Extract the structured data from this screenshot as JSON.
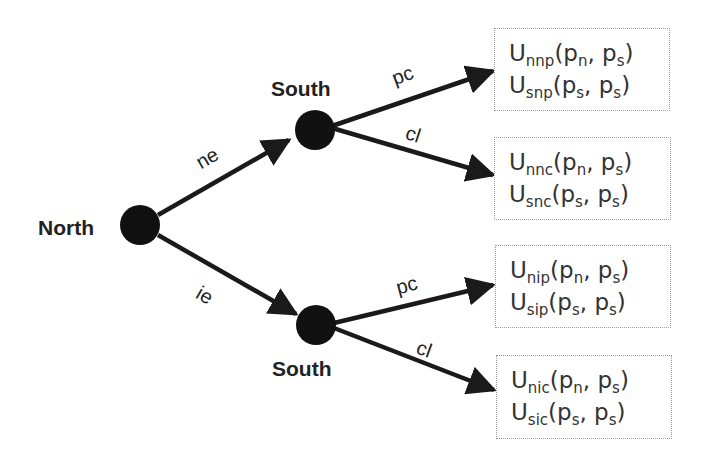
{
  "diagram": {
    "type": "game-tree",
    "nodes": {
      "north": {
        "label": "North"
      },
      "south_top": {
        "label": "South"
      },
      "south_bottom": {
        "label": "South"
      }
    },
    "edges": {
      "ne": {
        "label": "ne"
      },
      "ie": {
        "label": "ie"
      },
      "top_pc": {
        "label": "pc"
      },
      "top_cl": {
        "label": "cl"
      },
      "bottom_pc": {
        "label": "pc"
      },
      "bottom_cl": {
        "label": "cl"
      }
    },
    "payoffs": [
      {
        "line1": {
          "base": "U",
          "sub": "nnp",
          "open": "(p",
          "arg1sub": "n",
          "mid": ", p",
          "arg2sub": "s",
          "close": ")"
        },
        "line2": {
          "base": "U",
          "sub": "snp",
          "open": "(p",
          "arg1sub": "s",
          "mid": ", p",
          "arg2sub": "s",
          "close": ")"
        }
      },
      {
        "line1": {
          "base": "U",
          "sub": "nnc",
          "open": "(p",
          "arg1sub": "n",
          "mid": ", p",
          "arg2sub": "s",
          "close": ")"
        },
        "line2": {
          "base": "U",
          "sub": "snc",
          "open": "(p",
          "arg1sub": "s",
          "mid": ", p",
          "arg2sub": "s",
          "close": ")"
        }
      },
      {
        "line1": {
          "base": "U",
          "sub": "nip",
          "open": "(p",
          "arg1sub": "n",
          "mid": ", p",
          "arg2sub": "s",
          "close": ")"
        },
        "line2": {
          "base": "U",
          "sub": "sip",
          "open": "(p",
          "arg1sub": "s",
          "mid": ", p",
          "arg2sub": "s",
          "close": ")"
        }
      },
      {
        "line1": {
          "base": "U",
          "sub": "nic",
          "open": "(p",
          "arg1sub": "n",
          "mid": ", p",
          "arg2sub": "s",
          "close": ")"
        },
        "line2": {
          "base": "U",
          "sub": "sic",
          "open": "(p",
          "arg1sub": "s",
          "mid": ", p",
          "arg2sub": "s",
          "close": ")"
        }
      }
    ],
    "colors": {
      "ink": "#1a1a1a",
      "box_border": "#9a9a9a"
    }
  }
}
